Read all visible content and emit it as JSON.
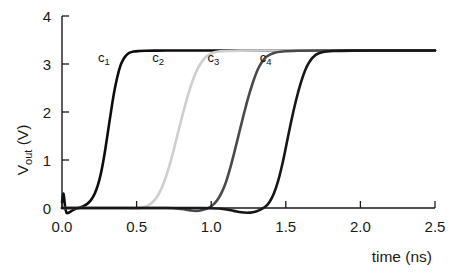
{
  "chart_data": {
    "type": "line",
    "title": "",
    "subtitle": "",
    "xlabel": "time (ns)",
    "ylabel": "V_out (V)",
    "ylabel_base": "V",
    "ylabel_sub": "out",
    "ylabel_unit": " (V)",
    "xlim": [
      0.0,
      2.5
    ],
    "ylim": [
      0.0,
      4.0
    ],
    "xticks": [
      0.0,
      0.5,
      1.0,
      1.5,
      2.0,
      2.5
    ],
    "xtick_labels": [
      "0.0",
      "0.5",
      "1.0",
      "1.5",
      "2.0",
      "2.5"
    ],
    "yticks": [
      0,
      1,
      2,
      3,
      4
    ],
    "ytick_labels": [
      "0",
      "1",
      "2",
      "3",
      "4"
    ],
    "grid": false,
    "legend_position": "inline-annotations",
    "plateau_voltage": 3.28,
    "baseline_voltage": 0.0,
    "annotations": [
      {
        "name": "c1",
        "base": "c",
        "sub": "1",
        "x": 0.28,
        "y": 3.05
      },
      {
        "name": "c2",
        "base": "c",
        "sub": "2",
        "x": 0.645,
        "y": 3.05
      },
      {
        "name": "c3",
        "base": "c",
        "sub": "3",
        "x": 1.015,
        "y": 3.05
      },
      {
        "name": "c4",
        "base": "c",
        "sub": "4",
        "x": 1.365,
        "y": 3.05
      }
    ],
    "series": [
      {
        "name": "c1",
        "color": "#0d0d0d",
        "stroke_width": 2.6,
        "delay_ns": 0.3,
        "rise_time_ns": 0.18,
        "x": [
          0.0,
          0.01,
          0.02,
          0.03,
          0.05,
          0.07,
          0.09,
          0.11,
          0.13,
          0.15,
          0.17,
          0.19,
          0.21,
          0.23,
          0.25,
          0.27,
          0.29,
          0.31,
          0.33,
          0.35,
          0.37,
          0.39,
          0.41,
          0.43,
          0.45,
          0.48,
          0.52,
          0.56,
          0.62,
          0.7,
          0.85,
          1.0,
          1.3,
          1.7,
          2.1,
          2.5
        ],
        "y": [
          0.12,
          0.3,
          0.05,
          -0.1,
          -0.09,
          -0.05,
          -0.02,
          0.0,
          0.02,
          0.05,
          0.09,
          0.15,
          0.24,
          0.38,
          0.58,
          0.86,
          1.22,
          1.63,
          2.04,
          2.42,
          2.72,
          2.95,
          3.09,
          3.18,
          3.23,
          3.26,
          3.27,
          3.275,
          3.278,
          3.28,
          3.28,
          3.28,
          3.28,
          3.28,
          3.28,
          3.28
        ]
      },
      {
        "name": "c2",
        "color": "#cfcfcf",
        "stroke_width": 2.6,
        "delay_ns": 0.72,
        "rise_time_ns": 0.18,
        "x": [
          0.0,
          0.05,
          0.12,
          0.2,
          0.3,
          0.4,
          0.48,
          0.52,
          0.55,
          0.58,
          0.61,
          0.64,
          0.67,
          0.7,
          0.73,
          0.76,
          0.79,
          0.82,
          0.85,
          0.88,
          0.91,
          0.94,
          0.97,
          1.0,
          1.05,
          1.1,
          1.2,
          1.35,
          1.6,
          1.9,
          2.2,
          2.5
        ],
        "y": [
          0.0,
          0.0,
          0.0,
          0.0,
          0.0,
          0.0,
          -0.01,
          0.0,
          0.02,
          0.06,
          0.13,
          0.25,
          0.43,
          0.68,
          0.99,
          1.35,
          1.72,
          2.08,
          2.41,
          2.69,
          2.91,
          3.06,
          3.16,
          3.22,
          3.26,
          3.27,
          3.278,
          3.28,
          3.28,
          3.28,
          3.28,
          3.28
        ]
      },
      {
        "name": "c3",
        "color": "#4a4a4a",
        "stroke_width": 2.6,
        "delay_ns": 1.09,
        "rise_time_ns": 0.18,
        "x": [
          0.0,
          0.1,
          0.25,
          0.4,
          0.55,
          0.7,
          0.8,
          0.86,
          0.9,
          0.94,
          0.98,
          1.01,
          1.04,
          1.07,
          1.1,
          1.13,
          1.16,
          1.19,
          1.22,
          1.25,
          1.28,
          1.31,
          1.34,
          1.37,
          1.42,
          1.48,
          1.58,
          1.75,
          2.0,
          2.25,
          2.5
        ],
        "y": [
          0.0,
          0.0,
          0.0,
          0.0,
          0.0,
          0.0,
          -0.02,
          -0.05,
          -0.06,
          -0.04,
          0.0,
          0.06,
          0.16,
          0.32,
          0.55,
          0.86,
          1.22,
          1.6,
          1.97,
          2.32,
          2.62,
          2.87,
          3.04,
          3.15,
          3.23,
          3.26,
          3.275,
          3.28,
          3.28,
          3.28,
          3.28
        ]
      },
      {
        "name": "c4",
        "color": "#161616",
        "stroke_width": 2.6,
        "delay_ns": 1.45,
        "rise_time_ns": 0.16,
        "x": [
          0.0,
          0.15,
          0.35,
          0.55,
          0.75,
          0.95,
          1.08,
          1.15,
          1.2,
          1.24,
          1.28,
          1.32,
          1.36,
          1.39,
          1.42,
          1.45,
          1.48,
          1.51,
          1.54,
          1.57,
          1.6,
          1.63,
          1.66,
          1.7,
          1.75,
          1.82,
          1.95,
          2.1,
          2.3,
          2.5
        ],
        "y": [
          0.0,
          0.0,
          0.0,
          0.0,
          0.0,
          0.0,
          -0.02,
          -0.06,
          -0.09,
          -0.1,
          -0.09,
          -0.05,
          0.02,
          0.12,
          0.3,
          0.58,
          0.96,
          1.41,
          1.86,
          2.26,
          2.6,
          2.87,
          3.05,
          3.19,
          3.25,
          3.27,
          3.278,
          3.28,
          3.28,
          3.28
        ]
      }
    ]
  }
}
